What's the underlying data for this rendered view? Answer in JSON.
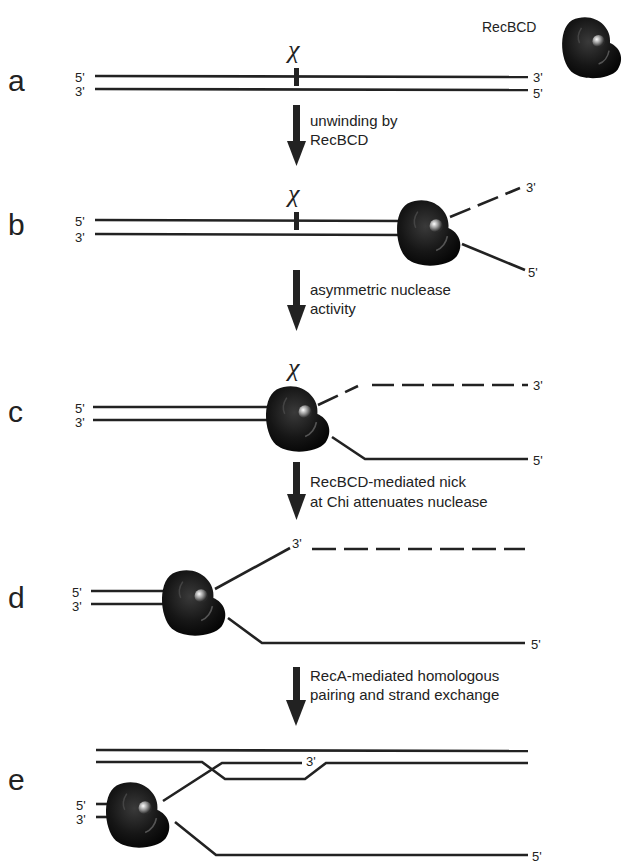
{
  "enzyme": {
    "name": "RecBCD"
  },
  "chi_symbol": "χ",
  "panels": [
    {
      "id": "a",
      "label": "a",
      "top_left_end": "5'",
      "bottom_left_end": "3'",
      "top_right_end": "3'",
      "bottom_right_end": "5'"
    },
    {
      "id": "b",
      "label": "b",
      "top_left_end": "5'",
      "bottom_left_end": "3'",
      "upper_tail_end": "3'",
      "lower_tail_end": "5'"
    },
    {
      "id": "c",
      "label": "c",
      "top_left_end": "5'",
      "bottom_left_end": "3'",
      "upper_tail_end": "3'",
      "lower_tail_end": "5'"
    },
    {
      "id": "d",
      "label": "d",
      "top_left_end": "5'",
      "bottom_left_end": "3'",
      "upper_tail_end": "3'",
      "lower_tail_end": "5'"
    },
    {
      "id": "e",
      "label": "e",
      "top_left_end": "5'",
      "bottom_left_end": "3'",
      "invading_end": "3'",
      "lower_tail_end": "5'"
    }
  ],
  "steps": [
    {
      "line1": "unwinding by",
      "line2": "RecBCD"
    },
    {
      "line1": "asymmetric nuclease",
      "line2": "activity"
    },
    {
      "line1": "RecBCD-mediated nick",
      "line2": "at Chi attenuates nuclease"
    },
    {
      "line1": "RecA-mediated homologous",
      "line2": "pairing and strand exchange"
    }
  ],
  "colors": {
    "ink": "#222222",
    "enzyme": "#111111",
    "background": "#ffffff"
  }
}
